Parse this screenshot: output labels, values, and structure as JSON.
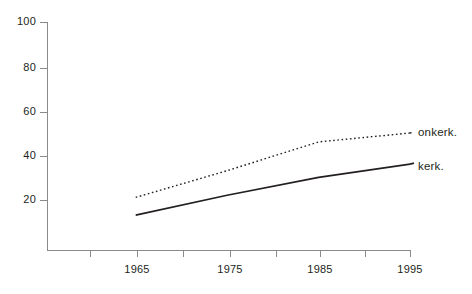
{
  "chart_data": {
    "type": "line",
    "title": "",
    "subtitle": "",
    "xlabel": "",
    "ylabel": "",
    "x": [
      1965,
      1975,
      1985,
      1995
    ],
    "xlim": [
      1960,
      1995
    ],
    "ylim": [
      0,
      100
    ],
    "grid": false,
    "legend_position": "right-inline",
    "x_ticks": [
      {
        "value": 1960,
        "label": "",
        "major": false
      },
      {
        "value": 1965,
        "label": "1965",
        "major": true
      },
      {
        "value": 1970,
        "label": "",
        "major": false
      },
      {
        "value": 1975,
        "label": "1975",
        "major": true
      },
      {
        "value": 1980,
        "label": "",
        "major": false
      },
      {
        "value": 1985,
        "label": "1985",
        "major": true
      },
      {
        "value": 1990,
        "label": "",
        "major": false
      },
      {
        "value": 1995,
        "label": "1995",
        "major": true
      }
    ],
    "y_ticks": [
      {
        "value": 20,
        "label": "20"
      },
      {
        "value": 40,
        "label": "40"
      },
      {
        "value": 60,
        "label": "60"
      },
      {
        "value": 80,
        "label": "80"
      },
      {
        "value": 100,
        "label": "100"
      }
    ],
    "series": [
      {
        "name": "onkerk.",
        "style": "dotted",
        "color": "#231f20",
        "values": [
          21,
          33,
          46,
          50
        ]
      },
      {
        "name": "kerk.",
        "style": "solid",
        "color": "#231f20",
        "values": [
          13,
          22,
          30,
          36
        ]
      }
    ]
  },
  "axes": {
    "axis_color": "#8a8a8a",
    "tick_color": "#8a8a8a"
  },
  "labels": {
    "y_100": "100",
    "y_80": "80",
    "y_60": "60",
    "y_40": "40",
    "y_20": "20",
    "x_1965": "1965",
    "x_1975": "1975",
    "x_1985": "1985",
    "x_1995": "1995",
    "series_onkerk": "onkerk.",
    "series_kerk": "kerk."
  }
}
